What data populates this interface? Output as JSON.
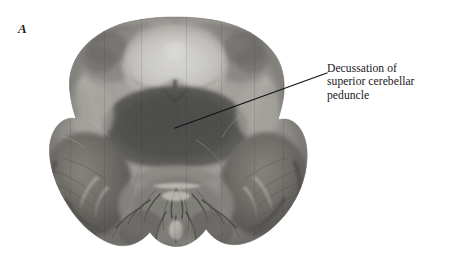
{
  "figure": {
    "panel_label": "A",
    "background_color": "#ffffff",
    "ink_color": "#17171a",
    "width": 453,
    "height": 256
  },
  "specimen": {
    "name": "brainstem-cerebellum-cross-section",
    "modality": "myelin-stained histological section",
    "palette": {
      "tissue_light": "#d8d6d2",
      "tissue_mid": "#9a9893",
      "tissue_dark": "#4e4d4b",
      "tissue_darkest": "#2b2b2b",
      "highlight": "#f2f1ee",
      "outline": "#6d6b67"
    }
  },
  "annotation": {
    "leader_line": {
      "name": "leader-line",
      "x1": 175,
      "y1": 128,
      "x2": 327,
      "y2": 73,
      "color": "#141414",
      "width": 1.2
    },
    "lines": [
      "Decussation of",
      "superior cerebellar",
      "peduncle"
    ],
    "full_text": "Decussation of superior cerebellar peduncle"
  }
}
